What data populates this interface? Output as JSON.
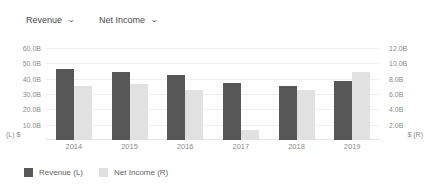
{
  "controls": {
    "left_metric": {
      "label": "Revenue",
      "icon": "chevron-down-icon",
      "caret": "⌄"
    },
    "right_metric": {
      "label": "Net Income",
      "icon": "chevron-down-icon",
      "caret": "⌄"
    }
  },
  "axes": {
    "left_corner": "(L)  $",
    "right_corner": "$  (R)",
    "left_ticks": [
      "60.0B",
      "50.0B",
      "40.0B",
      "30.0B",
      "20.0B",
      "10.0B"
    ],
    "right_ticks": [
      "12.0B",
      "10.0B",
      "8.0B",
      "6.0B",
      "4.0B",
      "2.0B"
    ]
  },
  "legend": [
    {
      "label": "Revenue (L)",
      "color": "#575757"
    },
    {
      "label": "Net Income (R)",
      "color": "#e1e1e1"
    }
  ],
  "colors": {
    "revenue_bar": "#575757",
    "net_income_bar": "#e1e1e1",
    "gridline": "#f0f0f0",
    "axis_text": "#8a8a8a"
  },
  "chart_data": {
    "type": "bar",
    "title": "",
    "xlabel": "",
    "ylabel": "",
    "grid": true,
    "legend_position": "bottom-left",
    "categories": [
      "2014",
      "2015",
      "2016",
      "2017",
      "2018",
      "2019"
    ],
    "series": [
      {
        "name": "Revenue (L)",
        "axis": "left",
        "unit": "$",
        "color": "#575757",
        "values": [
          46.0,
          44.5,
          42.2,
          37.0,
          35.4,
          38.7
        ],
        "value_labels": [
          "46.0B",
          "44.5B",
          "42.2B",
          "37.0B",
          "35.4B",
          "38.7B"
        ]
      },
      {
        "name": "Net Income (R)",
        "axis": "right",
        "unit": "$",
        "color": "#e1e1e1",
        "values": [
          7.0,
          7.3,
          6.5,
          1.3,
          6.5,
          8.9
        ],
        "value_labels": [
          "7.0B",
          "7.3B",
          "6.5B",
          "1.3B",
          "6.5B",
          "8.9B"
        ]
      }
    ],
    "left_axis": {
      "label": "(L)  $",
      "min": 0,
      "max": 60,
      "ticks": [
        10,
        20,
        30,
        40,
        50,
        60
      ],
      "tick_labels": [
        "10.0B",
        "20.0B",
        "30.0B",
        "40.0B",
        "50.0B",
        "60.0B"
      ]
    },
    "right_axis": {
      "label": "$  (R)",
      "min": 0,
      "max": 12,
      "ticks": [
        2,
        4,
        6,
        8,
        10,
        12
      ],
      "tick_labels": [
        "2.0B",
        "4.0B",
        "6.0B",
        "8.0B",
        "10.0B",
        "12.0B"
      ]
    }
  }
}
